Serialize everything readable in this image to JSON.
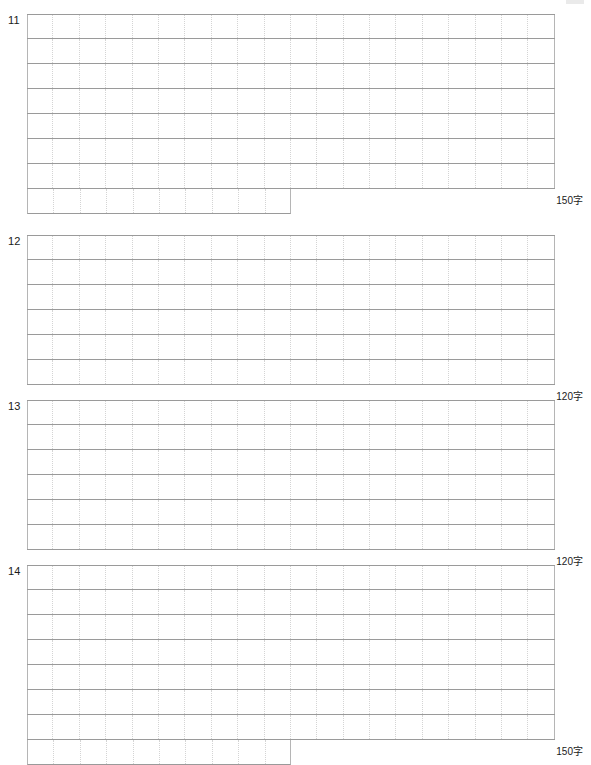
{
  "page": {
    "width": 591,
    "height": 760,
    "background_color": "#ffffff",
    "sheet_type": "genko-yoshi-answer-sheet"
  },
  "style": {
    "row_line_color": "#9a9a9a",
    "cell_divider_color": "#d4d4d4",
    "grid_border_color": "#b5b5b5",
    "text_color": "#1a1a1a"
  },
  "blocks": [
    {
      "number": "11",
      "count_label": "150字",
      "columns": 20,
      "full_rows": 7,
      "partial_row_cells": 10,
      "top": 14,
      "grid_left": 27,
      "grid_width": 528,
      "row_height": 25
    },
    {
      "number": "12",
      "count_label": "120字",
      "columns": 20,
      "full_rows": 6,
      "partial_row_cells": 0,
      "top": 235,
      "grid_left": 27,
      "grid_width": 528,
      "row_height": 25
    },
    {
      "number": "13",
      "count_label": "120字",
      "columns": 20,
      "full_rows": 6,
      "partial_row_cells": 0,
      "top": 400,
      "grid_left": 27,
      "grid_width": 528,
      "row_height": 25
    },
    {
      "number": "14",
      "count_label": "150字",
      "columns": 20,
      "full_rows": 7,
      "partial_row_cells": 10,
      "top": 565,
      "grid_left": 27,
      "grid_width": 528,
      "row_height": 25
    }
  ]
}
